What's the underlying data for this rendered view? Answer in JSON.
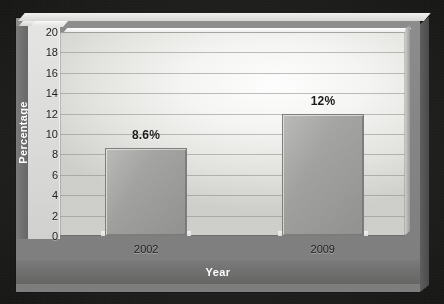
{
  "chart_data": {
    "type": "bar",
    "title": "",
    "subtitle": "",
    "xlabel": "Year",
    "ylabel": "Percentage",
    "categories": [
      "2002",
      "2009"
    ],
    "values": [
      8.6,
      12
    ],
    "data_labels": [
      "8.6%",
      "12%"
    ],
    "series": [
      {
        "name": "Percentage",
        "values": [
          8.6,
          12
        ]
      }
    ],
    "ylim": [
      0,
      20
    ],
    "ytick_values": [
      0,
      2,
      4,
      6,
      8,
      10,
      12,
      14,
      16,
      18,
      20
    ],
    "ytick_labels": [
      "0",
      "2",
      "4",
      "6",
      "8",
      "10",
      "12",
      "14",
      "16",
      "18",
      "20"
    ],
    "ytick_step": 2,
    "grid": true,
    "grid_orientation": "horizontal",
    "legend": false,
    "legend_position": "none",
    "style": "3d-bar",
    "colors": {
      "bar_fill": "#a2a2a0",
      "bar_edge": "#7e7e7c",
      "plot_background": "#f6f6f4",
      "panel_background": "#868686",
      "axis_band": "#6f6f6f",
      "axis_band_text": "#ffffff",
      "tick_text": "#1d1d1d",
      "label_text": "#1b1b1b",
      "gridline": "#8c8c88",
      "outer_border": "#1d1d1c"
    }
  },
  "axis": {
    "y_title": "Percentage",
    "x_title": "Year"
  }
}
